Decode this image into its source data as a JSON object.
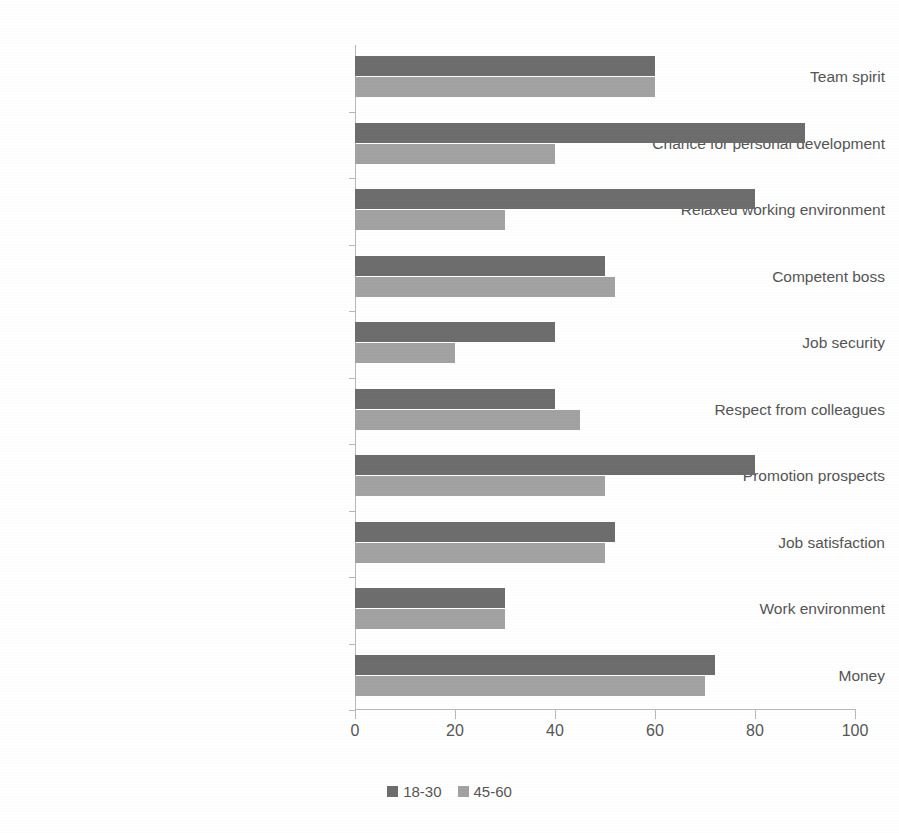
{
  "chart_data": {
    "type": "bar",
    "orientation": "horizontal",
    "title": "",
    "subtitle": "",
    "xlabel": "",
    "ylabel": "",
    "xlim": [
      0,
      100
    ],
    "xticks": [
      0,
      20,
      40,
      60,
      80,
      100
    ],
    "grid": false,
    "legend_position": "bottom",
    "categories": [
      "Team spirit",
      "Chance for personal development",
      "Relaxed working environment",
      "Competent boss",
      "Job security",
      "Respect from colleagues",
      "Promotion prospects",
      "Job satisfaction",
      "Work environment",
      "Money"
    ],
    "series": [
      {
        "name": "18-30",
        "color": "#6d6d6d",
        "values": [
          60,
          90,
          80,
          50,
          40,
          40,
          80,
          52,
          30,
          72
        ]
      },
      {
        "name": "45-60",
        "color": "#a2a2a2",
        "values": [
          60,
          40,
          30,
          52,
          20,
          45,
          50,
          50,
          30,
          70
        ]
      }
    ]
  },
  "legend": {
    "items": [
      {
        "label": "18-30",
        "color": "#6d6d6d"
      },
      {
        "label": "45-60",
        "color": "#a2a2a2"
      }
    ]
  },
  "axis": {
    "x_tick_labels": [
      "0",
      "20",
      "40",
      "60",
      "80",
      "100"
    ]
  },
  "colors": {
    "series_18_30": "#6d6d6d",
    "series_45_60": "#a2a2a2",
    "axis": "#b9b9b9",
    "text": "#555555",
    "background": "#ffffff"
  }
}
